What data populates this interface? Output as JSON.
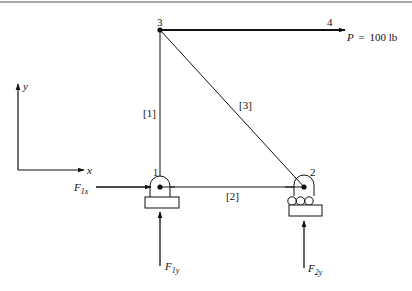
{
  "figure": {
    "type": "truss-free-body-diagram",
    "nodes": [
      {
        "id": "1",
        "label": "1",
        "x": 160,
        "y": 187,
        "support": "pin"
      },
      {
        "id": "2",
        "label": "2",
        "x": 304,
        "y": 187,
        "support": "roller"
      },
      {
        "id": "3",
        "label": "3",
        "x": 160,
        "y": 30,
        "support": "none"
      },
      {
        "id": "4",
        "label": "4",
        "x": 345,
        "y": 30,
        "support": "none"
      }
    ],
    "members": [
      {
        "label": "[1]",
        "from": "1",
        "to": "3"
      },
      {
        "label": "[2]",
        "from": "1",
        "to": "2"
      },
      {
        "label": "[3]",
        "from": "3",
        "to": "2"
      }
    ],
    "applied_load": {
      "symbol": "P",
      "equals": "=",
      "value": "100 lb",
      "at_node": "4",
      "direction": "right"
    },
    "reactions": [
      {
        "symbol": "F",
        "subscript": "1x",
        "direction": "right"
      },
      {
        "symbol": "F",
        "subscript": "1y",
        "direction": "up"
      },
      {
        "symbol": "F",
        "subscript": "2y",
        "direction": "up"
      }
    ],
    "axes": {
      "x_label": "x",
      "y_label": "y"
    }
  },
  "colors": {
    "line": "#111111",
    "top_rule": "#8a8a8a",
    "background": "#ffffff"
  }
}
